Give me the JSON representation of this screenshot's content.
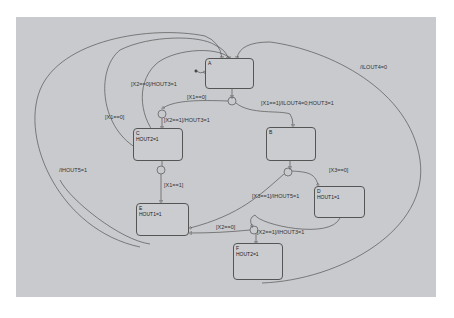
{
  "colors": {
    "background": "#ffffff",
    "panel": "#c9cacd",
    "line": "#555555",
    "text": "#222222"
  },
  "states": {
    "A": {
      "name": "A",
      "action": ""
    },
    "B": {
      "name": "B",
      "action": ""
    },
    "C": {
      "name": "C",
      "action": "HOUT2=1"
    },
    "D": {
      "name": "D",
      "action": "HOUT1=1"
    },
    "E": {
      "name": "E",
      "action": "HOUT1=1"
    },
    "F": {
      "name": "F",
      "action": "HOUT2=1"
    }
  },
  "transitions": {
    "a_loop_x2_0": "[X2==0]/HOUT3=1",
    "a_to_c_x1_0": "[X1==0]",
    "c_x2_1": "[X2==1]/HOUT3=1",
    "a_to_b_x1_1": "[X1==1]/ILOUT4=0;HOUT3=1",
    "outer_ilout4": "/ILOUT4=0",
    "outer_x1_0": "[X1==0]",
    "outer_hout5": "/IHOUT5=1",
    "c_to_e_x1_1": "[X1==1]",
    "b_to_d_x3_0": "[X3==0]",
    "b_to_e_x3_1": "[X3==1]/IHOUT5=1",
    "e_x2_0": "[X2==0]",
    "f_x2_1": "[X2==1]/IHOUT3=1"
  }
}
